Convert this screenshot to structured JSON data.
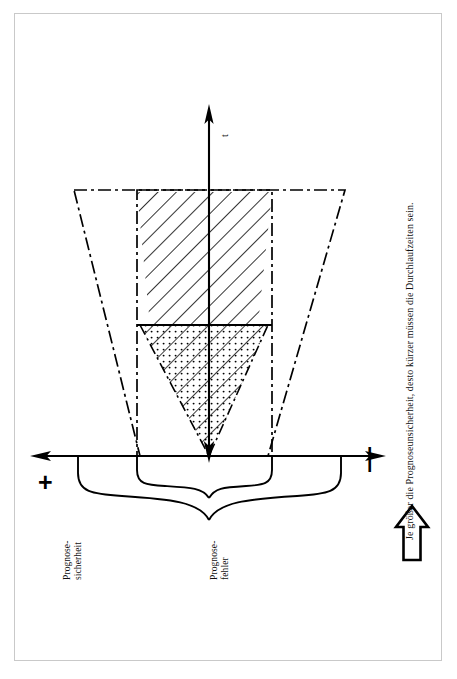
{
  "figure": {
    "title_hidden": "Prognosetrichter",
    "axis_t_label": "t",
    "plus_symbol": "+",
    "minus_symbol": "—",
    "label_left": "Prognose-\nsicherheit",
    "label_center": "Prognose-\nfehler",
    "caption": "Je größer die Prognoseunsicherheit, desto kürzer müssen die Durchlaufzeiten sein.",
    "colors": {
      "ink": "#000000",
      "frame": "#c9c9c9",
      "paper": "#ffffff"
    },
    "icons": {
      "up_block_arrow": "block-arrow-up",
      "time_axis_arrow": "arrow-up",
      "error_axis_arrow_left": "arrow-left",
      "error_axis_arrow_right": "arrow-right",
      "funnel_arrow_down": "arrow-down"
    },
    "regions": [
      {
        "name": "outer-forecast-funnel",
        "style": "dash-dot outline trapezoid",
        "meaning": "große Prognoseunsicherheit"
      },
      {
        "name": "inner-funnel-rectangle",
        "style": "dash-dot outline",
        "meaning": "enger Prognosebereich"
      },
      {
        "name": "hatched-cone",
        "style": "diagonal hatching",
        "meaning": "Prognosefehlerbereich lang"
      },
      {
        "name": "dotted-cone",
        "style": "dotted fill",
        "meaning": "Prognosefehlerbereich kurz"
      }
    ],
    "braces": [
      {
        "name": "outer-brace",
        "span": "wide"
      },
      {
        "name": "inner-brace",
        "span": "narrow"
      }
    ]
  }
}
